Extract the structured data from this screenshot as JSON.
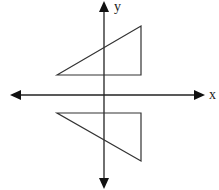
{
  "diagram": {
    "type": "coordinate-plane-reflection",
    "axes": {
      "x_label": "x",
      "y_label": "y",
      "origin_px": [
        104,
        95
      ],
      "x_axis": {
        "from": [
          10,
          95
        ],
        "to": [
          205,
          95
        ],
        "arrows": "both"
      },
      "y_axis": {
        "from": [
          104,
          1
        ],
        "to": [
          104,
          189
        ],
        "arrows": "both"
      }
    },
    "shapes": [
      {
        "name": "upper-triangle",
        "points": [
          [
            57,
            75
          ],
          [
            141,
            26
          ],
          [
            141,
            75
          ]
        ]
      },
      {
        "name": "lower-triangle",
        "points": [
          [
            57,
            113
          ],
          [
            141,
            113
          ],
          [
            141,
            161
          ]
        ]
      }
    ],
    "colors": {
      "stroke": "#222222",
      "background": "#ffffff"
    }
  }
}
